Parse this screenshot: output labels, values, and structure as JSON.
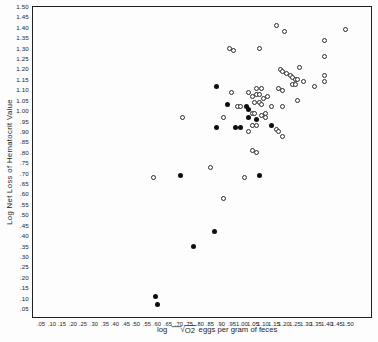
{
  "chart_data": {
    "type": "scatter",
    "title": "",
    "xlabel": "log √O2 eggs per gram of feces",
    "xlabel_parts": {
      "prefix": "log",
      "radical_glyph": "√",
      "radicand": "O2",
      "suffix": "eggs per gram of feces"
    },
    "ylabel": "Log Net Loss of Hematocrit Value",
    "xlim": [
      0.0,
      1.62
    ],
    "ylim": [
      0.02,
      1.52
    ],
    "grid": false,
    "legend": "none",
    "frame": "full-box",
    "x_ticks": [
      ".05",
      ".10",
      ".15",
      ".20",
      ".25",
      ".30",
      ".35",
      ".40",
      ".45",
      ".50",
      ".55",
      ".60",
      ".65",
      ".70",
      ".75",
      ".80",
      ".85",
      ".90",
      ".95",
      "1.00",
      "1.05",
      "1.10",
      "1.15",
      "1.20",
      "1.25",
      "1.30",
      "1.35",
      "1.40",
      "1.45",
      "1.50"
    ],
    "y_ticks": [
      "1.50",
      "1.45",
      "1.40",
      "1.35",
      "1.30",
      "1.25",
      "1.20",
      "1.15",
      "1.10",
      "1.05",
      "1.00",
      ".95",
      ".90",
      ".85",
      ".80",
      ".75",
      ".70",
      ".65",
      ".60",
      ".55",
      ".50",
      ".45",
      ".40",
      ".35",
      ".30",
      ".25",
      ".20",
      ".15",
      ".10",
      ".05"
    ],
    "marker_color": "#1c1c1c",
    "series": [
      {
        "name": "open-circles",
        "marker": "open-circle",
        "points": [
          [
            1.16,
            1.41
          ],
          [
            1.2,
            1.38
          ],
          [
            1.49,
            1.39
          ],
          [
            1.39,
            1.34
          ],
          [
            1.08,
            1.3
          ],
          [
            0.94,
            1.3
          ],
          [
            0.96,
            1.29
          ],
          [
            1.39,
            1.26
          ],
          [
            1.27,
            1.21
          ],
          [
            1.18,
            1.2
          ],
          [
            1.19,
            1.19
          ],
          [
            1.21,
            1.18
          ],
          [
            1.23,
            1.17
          ],
          [
            1.39,
            1.17
          ],
          [
            1.24,
            1.16
          ],
          [
            1.25,
            1.15
          ],
          [
            1.26,
            1.15
          ],
          [
            1.29,
            1.14
          ],
          [
            1.39,
            1.14
          ],
          [
            1.24,
            1.13
          ],
          [
            1.25,
            1.13
          ],
          [
            1.34,
            1.12
          ],
          [
            0.95,
            1.09
          ],
          [
            1.03,
            1.09
          ],
          [
            1.07,
            1.11
          ],
          [
            1.09,
            1.11
          ],
          [
            1.17,
            1.11
          ],
          [
            1.19,
            1.1
          ],
          [
            1.05,
            1.07
          ],
          [
            1.07,
            1.08
          ],
          [
            1.08,
            1.08
          ],
          [
            1.1,
            1.06
          ],
          [
            1.12,
            1.07
          ],
          [
            1.26,
            1.05
          ],
          [
            0.98,
            1.02
          ],
          [
            0.99,
            1.02
          ],
          [
            1.06,
            1.04
          ],
          [
            1.08,
            1.04
          ],
          [
            1.09,
            1.03
          ],
          [
            1.14,
            1.02
          ],
          [
            1.19,
            1.02
          ],
          [
            0.91,
            0.97
          ],
          [
            0.72,
            0.97
          ],
          [
            1.05,
            0.99
          ],
          [
            1.06,
            0.99
          ],
          [
            1.09,
            0.98
          ],
          [
            1.11,
            0.99
          ],
          [
            1.11,
            0.97
          ],
          [
            1.05,
            0.93
          ],
          [
            1.07,
            0.93
          ],
          [
            1.03,
            0.9
          ],
          [
            1.16,
            0.91
          ],
          [
            1.17,
            0.9
          ],
          [
            1.19,
            0.88
          ],
          [
            1.05,
            0.81
          ],
          [
            1.07,
            0.8
          ],
          [
            0.85,
            0.73
          ],
          [
            0.58,
            0.68
          ],
          [
            1.01,
            0.68
          ],
          [
            0.91,
            0.58
          ]
        ]
      },
      {
        "name": "filled-circles",
        "marker": "filled-circle",
        "points": [
          [
            0.88,
            1.12
          ],
          [
            0.93,
            1.03
          ],
          [
            1.02,
            1.02
          ],
          [
            1.03,
            1.01
          ],
          [
            1.03,
            0.97
          ],
          [
            1.07,
            0.96
          ],
          [
            0.88,
            0.92
          ],
          [
            0.97,
            0.92
          ],
          [
            0.99,
            0.92
          ],
          [
            1.14,
            0.93
          ],
          [
            0.71,
            0.69
          ],
          [
            1.08,
            0.69
          ],
          [
            0.87,
            0.42
          ],
          [
            0.77,
            0.35
          ],
          [
            0.59,
            0.11
          ],
          [
            0.6,
            0.07
          ]
        ]
      }
    ]
  }
}
